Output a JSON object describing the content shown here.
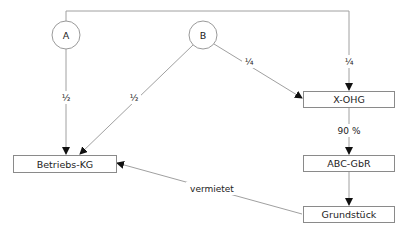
{
  "diagram": {
    "type": "ownership-structure",
    "nodes": {
      "A": {
        "label": "A",
        "shape": "circle"
      },
      "B": {
        "label": "B",
        "shape": "circle"
      },
      "betriebs_kg": {
        "label": "Betriebs-KG",
        "shape": "box"
      },
      "x_ohg": {
        "label": "X-OHG",
        "shape": "box"
      },
      "abc_gbr": {
        "label": "ABC-GbR",
        "shape": "box"
      },
      "grundstueck": {
        "label": "Grundstück",
        "shape": "box"
      }
    },
    "edges": [
      {
        "from": "A",
        "to": "betriebs_kg",
        "label": "½"
      },
      {
        "from": "B",
        "to": "betriebs_kg",
        "label": "½"
      },
      {
        "from": "B",
        "to": "x_ohg",
        "label": "¼"
      },
      {
        "from": "A",
        "to": "x_ohg",
        "label": "¼"
      },
      {
        "from": "x_ohg",
        "to": "abc_gbr",
        "label": "90 %"
      },
      {
        "from": "abc_gbr",
        "to": "grundstueck",
        "label": ""
      },
      {
        "from": "grundstueck",
        "to": "betriebs_kg",
        "label": "vermietet"
      }
    ],
    "edge_labels": {
      "a_to_kg": "½",
      "b_to_kg": "½",
      "b_to_ohg": "¼",
      "a_to_ohg": "¼",
      "ohg_to_gbr": "90 %",
      "grundstueck_to_kg": "vermietet"
    },
    "colors": {
      "line": "#9a9a9a",
      "box_border": "#8a8a8a",
      "arrowhead": "#111111",
      "text": "#222222"
    }
  }
}
